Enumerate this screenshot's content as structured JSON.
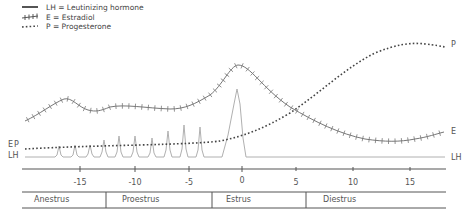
{
  "legend": {
    "items": [
      {
        "icon": "solid-line-icon",
        "label": "LH = Leutinizing hormone"
      },
      {
        "icon": "hatched-line-icon",
        "label": "E = Estradiol"
      },
      {
        "icon": "dotted-line-icon",
        "label": "P = Progesterone"
      }
    ]
  },
  "curve_labels": {
    "e_left": "E",
    "p_left": "P",
    "lh_left": "LH",
    "p_right": "P",
    "e_right": "E",
    "lh_right": "LH"
  },
  "axis": {
    "ticks": [
      "-15",
      "-10",
      "-5",
      "0",
      "5",
      "10",
      "15"
    ]
  },
  "phases": [
    "Anestrus",
    "Proestrus",
    "Estrus",
    "Diestrus"
  ],
  "colors": {
    "lh": "#a8a8a8",
    "estradiol": "#777777",
    "progesterone": "#444444",
    "axis": "#555555"
  }
}
